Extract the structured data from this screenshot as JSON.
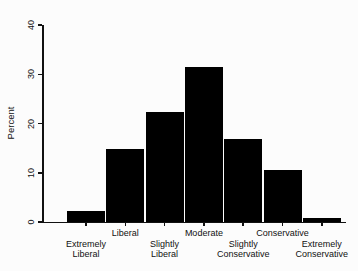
{
  "figure": {
    "background": "#fcfcfc"
  },
  "chart_data": {
    "type": "bar",
    "title": "",
    "xlabel": "",
    "ylabel": "Percent",
    "ylim": [
      0,
      40
    ],
    "yticks": [
      0,
      10,
      20,
      30,
      40
    ],
    "categories": [
      "Extremely Liberal",
      "Liberal",
      "Slightly Liberal",
      "Moderate",
      "Slightly Conservative",
      "Conservative",
      "Extremely Conservative"
    ],
    "values": [
      2.3,
      14.8,
      22.3,
      31.4,
      16.8,
      10.6,
      0.9
    ],
    "label_rows": [
      2,
      1,
      2,
      1,
      2,
      1,
      2
    ],
    "bar_color": "#000000",
    "axis_color": "#111111",
    "grid": false,
    "legend_position": "none",
    "y_tick_label_rotation": -90
  }
}
